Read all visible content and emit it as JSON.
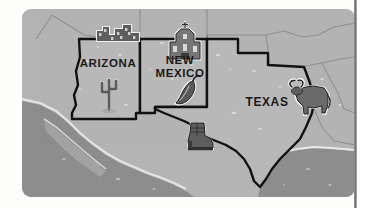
{
  "page": {
    "background_color": "#fdfdfb",
    "divider_color": "#6f6f6f"
  },
  "map": {
    "title": "Southwestern United States",
    "panel": {
      "land_color": "#b4b4b4",
      "water_color": "#8d8d8d",
      "highlight_color": "#d6d6d6",
      "outline_color": "#111111",
      "faint_border_color": "#8a8a8a",
      "corner_radius": 9
    },
    "states": [
      {
        "id": "arizona",
        "label": "ARIZONA",
        "label_x": 86,
        "label_y": 58,
        "icons": [
          "cactus-icon",
          "canyon-pueblo-icon"
        ]
      },
      {
        "id": "new-mexico",
        "label_line1": "NEW",
        "label_line2": "MEXICO",
        "label": "NEW MEXICO",
        "label_x": 158,
        "label_y": 55,
        "icons": [
          "mission-church-icon",
          "chile-pepper-icon"
        ]
      },
      {
        "id": "texas",
        "label": "TEXAS",
        "label_x": 245,
        "label_y": 97,
        "icons": [
          "longhorn-icon",
          "cowboy-boot-icon"
        ]
      }
    ],
    "icons": [
      {
        "name": "canyon-pueblo-icon",
        "state": "arizona",
        "x": 97,
        "y": 25,
        "description": "cliff dwelling / pueblo ruins"
      },
      {
        "name": "cactus-icon",
        "state": "arizona",
        "x": 87,
        "y": 85,
        "description": "saguaro cactus"
      },
      {
        "name": "mission-church-icon",
        "state": "new-mexico",
        "x": 163,
        "y": 33,
        "description": "adobe mission church with cross"
      },
      {
        "name": "chile-pepper-icon",
        "state": "new-mexico",
        "x": 163,
        "y": 82,
        "description": "red chile pepper"
      },
      {
        "name": "longhorn-icon",
        "state": "texas",
        "x": 289,
        "y": 88,
        "description": "longhorn steer"
      },
      {
        "name": "cowboy-boot-icon",
        "state": "texas",
        "x": 176,
        "y": 128,
        "description": "cowboy boot"
      }
    ],
    "water_bodies": [
      {
        "name": "pacific-ocean",
        "label": ""
      },
      {
        "name": "gulf-of-california",
        "label": ""
      },
      {
        "name": "gulf-of-mexico",
        "label": ""
      }
    ]
  }
}
